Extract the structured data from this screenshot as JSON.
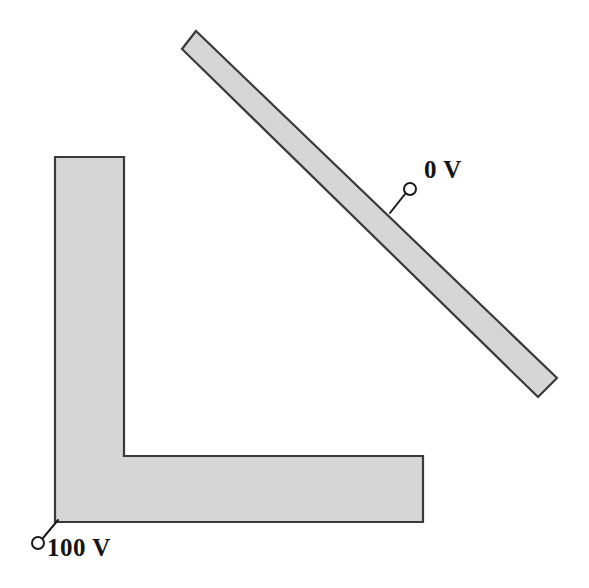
{
  "figure": {
    "background_color": "#ffffff",
    "width": 589,
    "height": 588
  },
  "style": {
    "conductor_fill": "#d6d6d6",
    "conductor_stroke": "#3a3a3a",
    "leader_stroke": "#1a1a1a",
    "terminal_fill": "#ffffff",
    "label_color": "#141414"
  },
  "conductors": [
    {
      "id": "l-shaped-conductor",
      "name": "L-shaped conductor",
      "shape": "L-bracket",
      "potential_label": "100 V",
      "potential_value": 100,
      "units": "V",
      "fill": "#d6d6d6",
      "stroke": "#3a3a3a",
      "points": "55,157 124,157 124,456 423,456 423,522 55,522"
    },
    {
      "id": "diagonal-conductor",
      "name": "Diagonal bar conductor",
      "shape": "rotated bar",
      "potential_label": "0 V",
      "potential_value": 0,
      "units": "V",
      "fill": "#d6d6d6",
      "stroke": "#3a3a3a",
      "points": "196,31 557,378 538,397 182,49"
    }
  ],
  "terminals": [
    {
      "id": "terminal-zero-v",
      "name": "0 V terminal",
      "label": "0 V",
      "circle": {
        "cx": 410,
        "cy": 189,
        "r": 6
      },
      "leader": {
        "x1": 405,
        "y1": 194,
        "x2": 390,
        "y2": 213
      },
      "label_position": {
        "left": 424,
        "top": 157
      }
    },
    {
      "id": "terminal-hundred-v",
      "name": "100 V terminal",
      "label": "100 V",
      "circle": {
        "cx": 38,
        "cy": 543,
        "r": 6
      },
      "leader": {
        "x1": 43,
        "y1": 538,
        "x2": 58,
        "y2": 520
      },
      "label_position": {
        "left": 47,
        "top": 535
      }
    }
  ],
  "labels": {
    "zero_v": "0 V",
    "hundred_v": "100 V"
  }
}
